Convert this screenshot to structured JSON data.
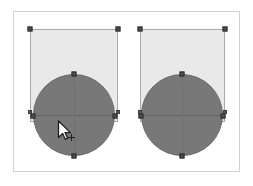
{
  "canvas": {
    "name": "drawing-canvas",
    "background_color": "#ffffff",
    "frame_border_color": "#d2d2d2",
    "frame": {
      "x": 13,
      "y": 11,
      "width": 227,
      "height": 161
    }
  },
  "palette": {
    "rect_fill": "#e9e9e9",
    "rect_stroke": "#a8a8a8",
    "circle_fill": "#787878",
    "circle_stroke": "#6a6a6a",
    "handle_fill": "#4d4d4d",
    "handle_stroke": "#2f2f2f",
    "guide_line": "#5f5f5f"
  },
  "shapes": [
    {
      "id": "shape-group-left",
      "label": "Left shape group",
      "selected": true,
      "rectangle": {
        "label": "Rectangle",
        "x": 30,
        "y": 29,
        "width": 88,
        "height": 93,
        "fill": "#e9e9e9",
        "stroke": "#a8a8a8"
      },
      "circle": {
        "label": "Ellipse",
        "cx": 74,
        "cy": 115,
        "radius": 41,
        "fill": "#787878",
        "stroke": "#6a6a6a"
      },
      "handles": [
        {
          "name": "handle-rect-top-left",
          "x": 30,
          "y": 29
        },
        {
          "name": "handle-rect-top-right",
          "x": 118,
          "y": 29
        },
        {
          "name": "handle-circle-top",
          "x": 74,
          "y": 74
        },
        {
          "name": "handle-circle-left",
          "x": 33,
          "y": 115
        },
        {
          "name": "handle-circle-right",
          "x": 115,
          "y": 115
        },
        {
          "name": "handle-circle-bottom",
          "x": 74,
          "y": 156
        },
        {
          "name": "handle-rect-mid-left",
          "x": 30,
          "y": 113
        },
        {
          "name": "handle-rect-mid-right",
          "x": 118,
          "y": 113
        }
      ],
      "anchor_dots": [
        {
          "name": "anchor-circle-top-inner",
          "x": 74,
          "y": 80
        },
        {
          "name": "anchor-circle-center",
          "x": 74,
          "y": 115
        }
      ]
    },
    {
      "id": "shape-group-right",
      "label": "Right shape group",
      "selected": true,
      "rectangle": {
        "label": "Rectangle",
        "x": 140,
        "y": 29,
        "width": 85,
        "height": 93,
        "fill": "#e9e9e9",
        "stroke": "#a8a8a8"
      },
      "circle": {
        "label": "Ellipse",
        "cx": 182,
        "cy": 115,
        "radius": 41,
        "fill": "#787878",
        "stroke": "#6a6a6a"
      },
      "handles": [
        {
          "name": "handle-rect-top-left",
          "x": 140,
          "y": 29
        },
        {
          "name": "handle-rect-top-right",
          "x": 225,
          "y": 29
        },
        {
          "name": "handle-circle-top",
          "x": 182,
          "y": 74
        },
        {
          "name": "handle-circle-left",
          "x": 141,
          "y": 115
        },
        {
          "name": "handle-circle-right",
          "x": 223,
          "y": 115
        },
        {
          "name": "handle-circle-bottom",
          "x": 182,
          "y": 156
        },
        {
          "name": "handle-rect-mid-left",
          "x": 140,
          "y": 113
        },
        {
          "name": "handle-rect-mid-right",
          "x": 225,
          "y": 113
        }
      ],
      "anchor_dots": [
        {
          "name": "anchor-circle-top-inner",
          "x": 182,
          "y": 80
        },
        {
          "name": "anchor-circle-center",
          "x": 182,
          "y": 115
        }
      ]
    }
  ],
  "cursor": {
    "name": "duplicate-cursor",
    "type": "arrow-with-plus",
    "x": 57,
    "y": 120
  }
}
